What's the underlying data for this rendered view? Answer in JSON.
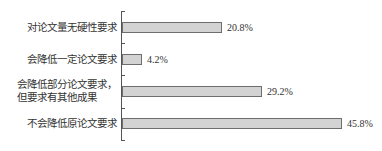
{
  "chart_data": {
    "type": "bar",
    "orientation": "horizontal",
    "title": "",
    "xlabel": "",
    "ylabel": "",
    "categories": [
      "对论文量无硬性要求",
      "会降低一定论文要求",
      "会降低部分论文要求，但要求有其他成果",
      "不会降低原论文要求"
    ],
    "category_lines": [
      [
        "对论文量无硬性要求"
      ],
      [
        "会降低一定论文要求"
      ],
      [
        "会降低部分论文要求，",
        "但要求有其他成果"
      ],
      [
        "不会降低原论文要求"
      ]
    ],
    "values": [
      20.8,
      4.2,
      29.2,
      45.8
    ],
    "value_labels": [
      "20.8%",
      "4.2%",
      "29.2%",
      "45.8%"
    ],
    "unit": "%",
    "xlim": [
      0,
      50
    ],
    "grid": false,
    "legend": null,
    "colors": {
      "bar_fill": "#d3d3d3",
      "bar_border": "#6e6e6e",
      "axis": "#555555",
      "text": "#333333"
    }
  }
}
